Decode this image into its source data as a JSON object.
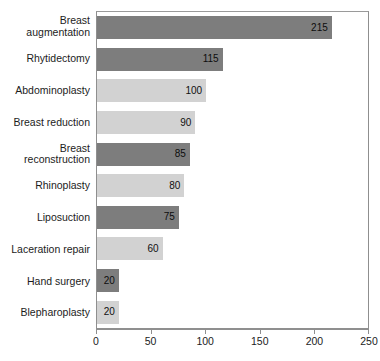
{
  "chart_data": {
    "type": "bar",
    "orientation": "horizontal",
    "title": "",
    "xlabel": "",
    "ylabel": "",
    "xlim": [
      0,
      250
    ],
    "xticks": [
      0,
      50,
      100,
      150,
      200,
      250
    ],
    "tick_labels": [
      "0",
      "50",
      "100",
      "150",
      "200",
      "250"
    ],
    "grid": false,
    "legend": false,
    "categories": [
      "Breast\naugmentation",
      "Rhytidectomy",
      "Abdominoplasty",
      "Breast reduction",
      "Breast reconstruction",
      "Rhinoplasty",
      "Liposuction",
      "Laceration repair",
      "Hand surgery",
      "Blepharoplasty"
    ],
    "values": [
      215,
      115,
      100,
      90,
      85,
      80,
      75,
      60,
      20,
      20
    ],
    "value_labels": [
      "215",
      "115",
      "100",
      "90",
      "85",
      "80",
      "75",
      "60",
      "20",
      "20"
    ],
    "bar_shades": [
      "dark",
      "dark",
      "light",
      "light",
      "dark",
      "light",
      "dark",
      "light",
      "dark",
      "light"
    ],
    "colors": {
      "dark_bar": "#7d7d7d",
      "light_bar": "#d2d2d2",
      "axis": "#8f8f8f",
      "text": "#1c1c1c",
      "background": "#ffffff"
    }
  },
  "caption": {
    "text": ""
  }
}
